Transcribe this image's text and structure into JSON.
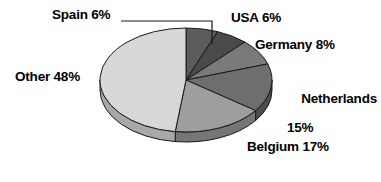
{
  "chart_data": {
    "type": "pie",
    "title": "",
    "xlabel": "",
    "ylabel": "",
    "legend_position": "none",
    "grid": false,
    "unit": "%",
    "categories": [
      "Spain",
      "USA",
      "Germany",
      "Netherlands",
      "Belgium",
      "Other"
    ],
    "values": [
      6,
      6,
      8,
      15,
      17,
      48
    ],
    "labels": [
      "Spain 6%",
      "USA 6%",
      "Germany 8%",
      "Netherlands 15%",
      "Belgium 17%",
      "Other 48%"
    ],
    "slices": [
      {
        "name": "Spain",
        "value": 6,
        "label": "Spain 6%",
        "color": "#5c5c5c",
        "side_color": "#3d3d3d",
        "leader_line": true
      },
      {
        "name": "USA",
        "value": 6,
        "label": "USA 6%",
        "color": "#4a4a4a",
        "side_color": "#313131",
        "leader_line": false
      },
      {
        "name": "Germany",
        "value": 8,
        "label": "Germany 8%",
        "color": "#7a7a7a",
        "side_color": "#565656",
        "leader_line": false
      },
      {
        "name": "Netherlands",
        "value": 15,
        "label": "Netherlands 15%",
        "color": "#6e6e6e",
        "side_color": "#4d4d4d",
        "leader_line": false
      },
      {
        "name": "Belgium",
        "value": 17,
        "label": "Belgium 17%",
        "color": "#9e9e9e",
        "side_color": "#767676",
        "leader_line": false
      },
      {
        "name": "Other",
        "value": 48,
        "label": "Other 48%",
        "color": "#d8d8d8",
        "side_color": "#a9a9a9",
        "leader_line": false
      }
    ],
    "start_angle_deg": 0,
    "direction": "clockwise",
    "style": "3d-pie",
    "colors": {
      "spain": "#5c5c5c",
      "usa": "#4a4a4a",
      "germany": "#7a7a7a",
      "netherlands": "#6e6e6e",
      "belgium": "#9e9e9e",
      "other": "#d8d8d8",
      "outline": "#1a1a1a",
      "label_text": "#000000",
      "background": "#ffffff"
    }
  },
  "labels": {
    "spain": "Spain 6%",
    "usa": "USA 6%",
    "germany": "Germany 8%",
    "netherlands_name": "Netherlands",
    "netherlands_pct": "15%",
    "belgium": "Belgium 17%",
    "other": "Other 48%"
  }
}
